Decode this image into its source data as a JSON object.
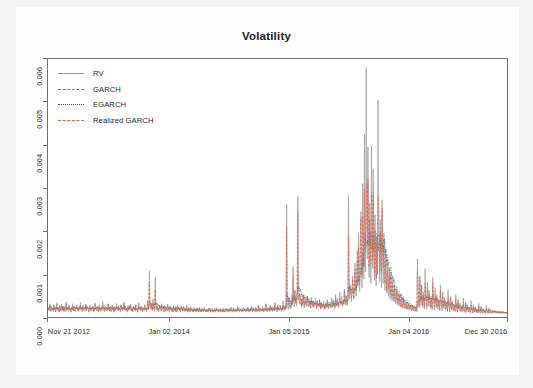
{
  "chart_data": {
    "type": "line",
    "title": "Volatility",
    "xlabel": "",
    "ylabel": "",
    "ylim": [
      0,
      0.006
    ],
    "ytick_labels": [
      "0.000",
      "0.001",
      "0.002",
      "0.003",
      "0.004",
      "0.005",
      "0.006"
    ],
    "ytick_values": [
      0.0,
      0.001,
      0.002,
      0.003,
      0.004,
      0.005,
      0.006
    ],
    "xtick_labels": [
      "Nov 21 2012",
      "Jan 02 2014",
      "Jan 05 2015",
      "Jan 04 2016",
      "Dec 30 2016"
    ],
    "xtick_positions": [
      0.0,
      0.265,
      0.525,
      0.785,
      1.0
    ],
    "grid": false,
    "legend_position": "top-left",
    "legend": [
      {
        "name": "RV",
        "color": "#9a9a9a",
        "style": "solid"
      },
      {
        "name": "GARCH",
        "color": "#5b7fa6",
        "style": "dashed"
      },
      {
        "name": "EGARCH",
        "color": "#2f5d3f",
        "style": "dotted"
      },
      {
        "name": "Realized GARCH",
        "color": "#d9604a",
        "style": "dashed"
      }
    ],
    "series": [
      {
        "name": "RV",
        "color": "#9a9a9a",
        "style": "solid",
        "values": [
          0.00018,
          0.00022,
          0.00014,
          0.00031,
          0.00019,
          0.00012,
          0.00026,
          0.00016,
          0.00021,
          0.00013,
          0.00029,
          0.00017,
          0.00024,
          0.00012,
          0.0002,
          0.00033,
          0.00015,
          0.00023,
          0.00018,
          0.00011,
          0.00027,
          0.00014,
          0.00019,
          0.0003,
          0.00016,
          0.00022,
          0.00013,
          0.00025,
          0.00017,
          0.00012,
          0.00021,
          0.00035,
          0.00015,
          0.00019,
          0.00024,
          0.00013,
          0.00028,
          0.00016,
          0.0002,
          0.00011,
          0.00023,
          0.00018,
          0.00031,
          0.00014,
          0.00026,
          0.00017,
          0.00012,
          0.00022,
          0.00019,
          0.00029,
          0.00015,
          0.00021,
          0.00013,
          0.00024,
          0.00018,
          0.00034,
          0.00016,
          0.00023,
          0.00012,
          0.00027,
          0.00019,
          0.00014,
          0.00022,
          0.00017,
          0.0003,
          0.00013,
          0.00025,
          0.00018,
          0.00021,
          0.00011,
          0.00016,
          0.00028,
          0.00019,
          0.00013,
          0.00023,
          0.00017,
          0.00026,
          0.00012,
          0.0002,
          0.00015,
          0.00033,
          0.00018,
          0.00022,
          0.00014,
          0.00025,
          0.00019,
          0.00011,
          0.00029,
          0.00016,
          0.00021,
          0.00013,
          0.00024,
          0.00018,
          0.00036,
          0.00015,
          0.0002,
          0.00012,
          0.00027,
          0.00017,
          0.00023,
          0.00014,
          0.00019,
          0.00031,
          0.00016,
          0.00022,
          0.00012,
          0.00025,
          0.00018,
          0.00013,
          0.00028,
          0.00017,
          0.00021,
          0.00011,
          0.00024,
          0.00019,
          0.00015,
          0.00032,
          0.00018,
          0.00023,
          0.00013,
          0.00026,
          0.00016,
          0.0002,
          0.00012,
          0.00029,
          0.00017,
          0.00022,
          0.00014,
          0.00019,
          0.00035,
          0.00016,
          0.00024,
          0.00013,
          0.00021,
          0.00018,
          0.00011,
          0.00027,
          0.00015,
          0.00023,
          0.00019,
          0.0003,
          0.00014,
          0.0002,
          0.00017,
          0.00012,
          0.00025,
          0.00018,
          0.00022,
          0.00013,
          0.00028,
          0.00016,
          0.00019,
          0.00011,
          0.00024,
          0.00033,
          0.00017,
          0.00021,
          0.00014,
          0.00026,
          0.00018,
          0.00012,
          0.00023,
          0.00019,
          0.00015,
          0.00029,
          0.00017,
          0.00022,
          0.00013,
          0.0002,
          0.00038,
          0.00025,
          0.00016,
          0.00108,
          0.00032,
          0.00021,
          0.00018,
          0.00027,
          0.00014,
          0.00042,
          0.00019,
          0.00024,
          0.00013,
          0.00093,
          0.00022,
          0.00017,
          0.00029,
          0.00015,
          0.00021,
          0.00012,
          0.00026,
          0.00018,
          0.00023,
          0.00014,
          0.00031,
          0.00019,
          0.00016,
          0.00024,
          0.00011,
          0.00027,
          0.00018,
          0.00013,
          0.00022,
          0.00017,
          0.00029,
          0.00015,
          0.0002,
          0.00012,
          0.00025,
          0.00018,
          0.00023,
          0.00014,
          0.00019,
          0.00011,
          0.00026,
          0.00016,
          0.00021,
          0.00013,
          0.00024,
          0.00017,
          0.00012,
          0.00028,
          0.00018,
          0.00022,
          0.00014,
          0.0002,
          0.00011,
          0.00025,
          0.00016,
          0.00019,
          0.00013,
          0.00023,
          0.00017,
          0.00012,
          0.00021,
          0.00015,
          0.00026,
          0.00018,
          0.00011,
          0.00022,
          0.00014,
          0.00019,
          0.00012,
          0.00024,
          0.00016,
          0.0002,
          0.00013,
          0.00017,
          0.00011,
          0.00023,
          0.00015,
          0.00018,
          0.00012,
          0.00021,
          0.00014,
          0.00019,
          0.00011,
          0.00016,
          0.00022,
          0.00013,
          0.00017,
          0.00012,
          0.0002,
          0.00015,
          0.00018,
          0.00011,
          0.00023,
          0.00014,
          0.00016,
          0.00012,
          0.00019,
          0.00013,
          0.00017,
          0.00011,
          0.00021,
          0.00015,
          0.00018,
          0.00012,
          0.00016,
          0.00014,
          0.0002,
          0.00011,
          0.00017,
          0.00013,
          0.00019,
          0.00012,
          0.00015,
          0.00022,
          0.00014,
          0.00018,
          0.00011,
          0.00016,
          0.00013,
          0.0002,
          0.00012,
          0.00017,
          0.00015,
          0.00011,
          0.00019,
          0.00014,
          0.00018,
          0.00012,
          0.00016,
          0.00021,
          0.00013,
          0.00017,
          0.00011,
          0.00015,
          0.00019,
          0.00012,
          0.00018,
          0.00014,
          0.00022,
          0.00013,
          0.00016,
          0.00011,
          0.0002,
          0.00015,
          0.00017,
          0.00012,
          0.00019,
          0.00013,
          0.00016,
          0.00024,
          0.00014,
          0.00018,
          0.00011,
          0.00021,
          0.00015,
          0.00017,
          0.00012,
          0.00019,
          0.00013,
          0.00022,
          0.00016,
          0.00014,
          0.00018,
          0.00011,
          0.0002,
          0.00015,
          0.00023,
          0.00013,
          0.00017,
          0.00012,
          0.00019,
          0.00014,
          0.00026,
          0.00016,
          0.00011,
          0.00021,
          0.00018,
          0.00013,
          0.00015,
          0.00023,
          0.00012,
          0.00019,
          0.00016,
          0.00014,
          0.00028,
          0.00017,
          0.00011,
          0.00022,
          0.00015,
          0.00018,
          0.00013,
          0.00025,
          0.00016,
          0.00012,
          0.0002,
          0.00017,
          0.00014,
          0.00031,
          0.00018,
          0.00013,
          0.00022,
          0.00016,
          0.00019,
          0.00012,
          0.00027,
          0.00015,
          0.00021,
          0.00017,
          0.00013,
          0.00024,
          0.00018,
          0.00014,
          0.00034,
          0.00019,
          0.00016,
          0.00022,
          0.00012,
          0.00029,
          0.00017,
          0.0002,
          0.00015,
          0.00026,
          0.00018,
          0.00013,
          0.00023,
          0.00016,
          0.00038,
          0.00019,
          0.00014,
          0.00027,
          0.00017,
          0.00021,
          0.00262,
          0.00035,
          0.00022,
          0.00018,
          0.00045,
          0.00026,
          0.00019,
          0.00033,
          0.00021,
          0.00052,
          0.00028,
          0.00117,
          0.00038,
          0.00024,
          0.00061,
          0.00031,
          0.00044,
          0.00025,
          0.00072,
          0.00281,
          0.00039,
          0.00055,
          0.00029,
          0.00048,
          0.00035,
          0.00023,
          0.00041,
          0.00027,
          0.00052,
          0.00032,
          0.00021,
          0.00044,
          0.00028,
          0.00037,
          0.00024,
          0.00049,
          0.0003,
          0.00022,
          0.00041,
          0.00026,
          0.00035,
          0.0002,
          0.00046,
          0.00029,
          0.00024,
          0.00038,
          0.00021,
          0.00033,
          0.00026,
          0.00043,
          0.00028,
          0.00019,
          0.00036,
          0.00024,
          0.00031,
          0.00022,
          0.0004,
          0.00027,
          0.00018,
          0.00034,
          0.00023,
          0.00029,
          0.00021,
          0.00037,
          0.00025,
          0.00017,
          0.00032,
          0.00022,
          0.00028,
          0.00041,
          0.00024,
          0.00019,
          0.00035,
          0.00026,
          0.0003,
          0.00021,
          0.00046,
          0.00028,
          0.00023,
          0.00038,
          0.00025,
          0.00033,
          0.0002,
          0.00052,
          0.00031,
          0.00026,
          0.00043,
          0.00029,
          0.00022,
          0.00036,
          0.00058,
          0.00033,
          0.00027,
          0.00048,
          0.00031,
          0.00024,
          0.00041,
          0.00029,
          0.00065,
          0.00036,
          0.00028,
          0.0005,
          0.00033,
          0.00026,
          0.00044,
          0.00282,
          0.00059,
          0.00041,
          0.00075,
          0.00048,
          0.00035,
          0.00062,
          0.00095,
          0.00054,
          0.00041,
          0.00078,
          0.00125,
          0.00065,
          0.00048,
          0.00102,
          0.00155,
          0.00072,
          0.00195,
          0.00112,
          0.00058,
          0.00165,
          0.00245,
          0.00095,
          0.00068,
          0.0031,
          0.00185,
          0.00088,
          0.00425,
          0.00225,
          0.00105,
          0.0058,
          0.00275,
          0.00135,
          0.00395,
          0.00175,
          0.00092,
          0.00265,
          0.00145,
          0.00078,
          0.00398,
          0.00215,
          0.00112,
          0.00345,
          0.00162,
          0.00085,
          0.00238,
          0.00128,
          0.00072,
          0.00185,
          0.00098,
          0.00505,
          0.00285,
          0.00148,
          0.00082,
          0.00225,
          0.00118,
          0.00068,
          0.00272,
          0.00142,
          0.00078,
          0.00195,
          0.00105,
          0.00062,
          0.00158,
          0.00088,
          0.00055,
          0.00132,
          0.00075,
          0.00048,
          0.00112,
          0.00065,
          0.00042,
          0.00098,
          0.00058,
          0.00038,
          0.00085,
          0.00052,
          0.00035,
          0.00074,
          0.00046,
          0.00031,
          0.00065,
          0.00041,
          0.00028,
          0.00058,
          0.00037,
          0.00025,
          0.00052,
          0.00034,
          0.00023,
          0.00046,
          0.00031,
          0.00021,
          0.00042,
          0.00028,
          0.00019,
          0.00038,
          0.00026,
          0.00018,
          0.00035,
          0.00024,
          0.00017,
          0.00032,
          0.00022,
          0.00016,
          0.00029,
          0.00021,
          0.00015,
          0.00027,
          0.00019,
          0.00014,
          0.00025,
          0.00018,
          0.00013,
          0.00023,
          0.00017,
          0.00012,
          0.00135,
          0.00068,
          0.00032,
          0.00021,
          0.00095,
          0.00048,
          0.00026,
          0.00072,
          0.00038,
          0.00022,
          0.00058,
          0.00031,
          0.00019,
          0.00112,
          0.00052,
          0.00028,
          0.00018,
          0.00082,
          0.00041,
          0.00024,
          0.00062,
          0.00033,
          0.0002,
          0.00048,
          0.00027,
          0.00017,
          0.00092,
          0.00044,
          0.00025,
          0.00016,
          0.00068,
          0.00035,
          0.00021,
          0.00052,
          0.00029,
          0.00018,
          0.00041,
          0.00024,
          0.00015,
          0.00075,
          0.00036,
          0.00022,
          0.00014,
          0.00058,
          0.00031,
          0.00019,
          0.00045,
          0.00026,
          0.00016,
          0.00035,
          0.00021,
          0.00013,
          0.00062,
          0.00029,
          0.00018,
          0.00012,
          0.00048,
          0.00025,
          0.00016,
          0.00038,
          0.00022,
          0.00014,
          0.0003,
          0.00018,
          0.00012,
          0.00052,
          0.00024,
          0.00015,
          0.00011,
          0.00041,
          0.00021,
          0.00014,
          0.00032,
          0.00019,
          0.00012,
          0.00026,
          0.00016,
          0.00011,
          0.00044,
          0.00021,
          0.00013,
          0.0001,
          0.00035,
          0.00018,
          0.00012,
          0.00027,
          0.00016,
          0.00011,
          0.00022,
          0.00014,
          0.0001,
          0.00038,
          0.00018,
          0.00012,
          9e-05,
          0.00029,
          0.00015,
          0.00011,
          0.00023,
          0.00013,
          0.0001,
          0.00019,
          0.00012,
          9e-05,
          0.00032,
          0.00016,
          0.00011,
          8e-05,
          0.00025,
          0.00013,
          0.0001,
          0.0002,
          0.00012,
          9e-05,
          0.00016,
          0.00011,
          8e-05,
          0.00027,
          0.00014,
          0.0001,
          8e-05,
          0.00021,
          0.00012,
          9e-05,
          0.00017,
          0.00011,
          8e-05,
          0.00014,
          0.0001,
          0.00013,
          9e-05,
          0.00015,
          0.00011,
          9e-05,
          0.00012,
          0.0001,
          8e-05,
          0.00014,
          9e-05,
          0.00011,
          8e-05,
          0.00012,
          0.0001,
          9e-05,
          0.00013,
          8e-05,
          0.00011,
          9e-05,
          0.0001,
          0.00012,
          8e-05,
          0.00011,
          9e-05
        ]
      },
      {
        "name": "GARCH",
        "color": "#5b7fa6",
        "style": "dashed",
        "note": "smoothed conditional variance, tracks RV envelope with lower peaks"
      },
      {
        "name": "EGARCH",
        "color": "#2f5d3f",
        "style": "dotted",
        "note": "exponential GARCH conditional variance, similar envelope to GARCH"
      },
      {
        "name": "Realized GARCH",
        "color": "#d9604a",
        "style": "dashed",
        "note": "realized GARCH conditional variance, closest to RV, peaks near 0.0029"
      }
    ],
    "peaks": [
      {
        "label": "max RV spike",
        "value": 0.0058,
        "approx_x": 0.675
      },
      {
        "label": "second RV spike",
        "value": 0.00505,
        "approx_x": 0.735
      },
      {
        "label": "2013 spike",
        "value": 0.00108,
        "approx_x": 0.205
      },
      {
        "label": "2015 spike",
        "value": 0.00262,
        "approx_x": 0.525
      }
    ]
  }
}
